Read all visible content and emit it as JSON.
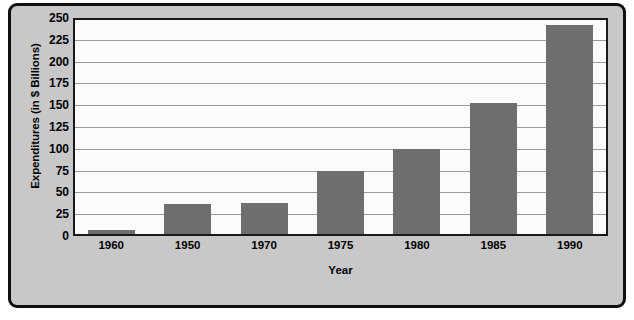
{
  "chart_data": {
    "type": "bar",
    "title": "",
    "xlabel": "Year",
    "ylabel": "Expenditures (in $ Billions)",
    "categories": [
      "1960",
      "1950",
      "1970",
      "1975",
      "1980",
      "1985",
      "1990"
    ],
    "values": [
      5,
      34,
      36,
      72,
      97,
      150,
      240
    ],
    "series": [
      {
        "name": "Expenditures",
        "values": [
          5,
          34,
          36,
          72,
          97,
          150,
          240
        ]
      }
    ],
    "ylim": [
      0,
      250
    ],
    "ytick_values": [
      0,
      25,
      50,
      75,
      100,
      125,
      150,
      175,
      200,
      225,
      250
    ],
    "ytick_labels": [
      "0",
      "25",
      "50",
      "75",
      "100",
      "125",
      "150",
      "175",
      "200",
      "225",
      "250"
    ],
    "grid": "horizontal",
    "legend": "none",
    "bar_color": "#6e6e6e",
    "plot_background": "#fbfbfb",
    "panel_background": "#c8c8c8",
    "gridline_color": "#9a9a9a",
    "axis_color": "#1a1a1a",
    "text_color": "#000000"
  }
}
